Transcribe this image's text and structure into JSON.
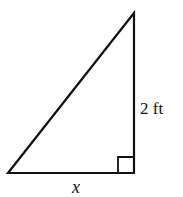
{
  "diagram": {
    "type": "right-triangle",
    "vertices": {
      "top": [
        134,
        13
      ],
      "right_angle": [
        134,
        173
      ],
      "left": [
        8,
        173
      ]
    },
    "labels": {
      "vertical_side": "2 ft",
      "horizontal_side": "x"
    },
    "right_angle_marker": true,
    "stroke_color": "#111111"
  }
}
